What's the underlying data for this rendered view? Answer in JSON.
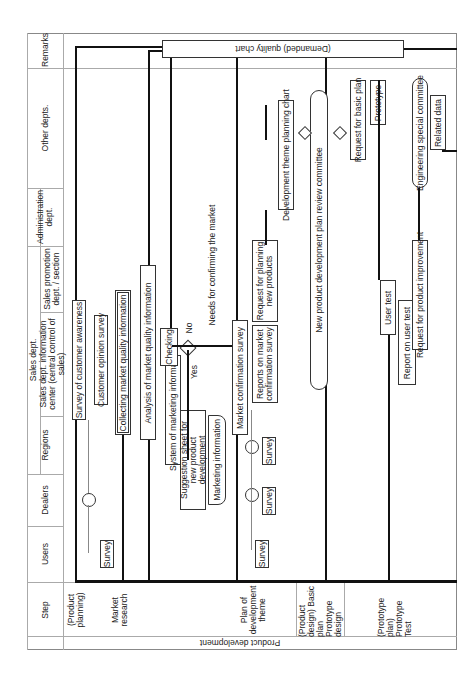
{
  "header": {
    "step": "Step",
    "remarks": "Remarks",
    "other_depts": "Other depts.",
    "sales_dept": "Sales dept.",
    "administration": "Administration dept.",
    "sales_promotion": "Sales promotion dept. / section",
    "info_center": "Sales dept. information center (central control of sales)",
    "regions": "Regions",
    "dealers": "Dealers",
    "users": "Users"
  },
  "side_label": "Product development",
  "steps": [
    {
      "label": "(Product planning)"
    },
    {
      "label": "Market research"
    },
    {
      "label": "Plan of development theme"
    },
    {
      "label": "(Product design) Basic plan Prototype design"
    },
    {
      "label": "(Prototype plan) Prototype Test"
    }
  ],
  "nodes": {
    "quality_chart": "(Demanded) quality chart",
    "survey_awareness": "Survey of customer awareness",
    "customer_opinion": "Customer opinion survey",
    "collecting_mqi": "Collecting market quality information",
    "analysis_mqi": "Analysis of market quality information",
    "system_marketing": "System of marketing information",
    "suggestion_sheet": "Suggestion sheet for new product development",
    "marketing_info": "Marketing information",
    "checking": "Checking",
    "needs_confirm": "Needs for confirming the market",
    "yes": "Yes",
    "no": "No",
    "market_confirm": "Market confirmation survey",
    "reports_confirm": "Reports on market confirmation survey",
    "request_planning": "Request for planning new products",
    "dev_theme_chart": "Development theme planning chart",
    "review_committee": "New product development plan review committee",
    "request_basic": "Request for basic plan",
    "prototype": "Prototype",
    "user_test": "User test",
    "report_user_test": "Report on user test",
    "request_improvement": "Request for product improvement",
    "eng_committee": "Engineering special committee",
    "related_data": "Related data",
    "survey": "Survey"
  }
}
